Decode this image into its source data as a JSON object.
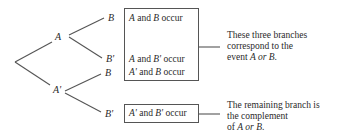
{
  "nodes": {
    "a": "A",
    "a_prime": "A'",
    "b_upper": "B",
    "b_prime_upper": "B'",
    "b_lower": "B",
    "b_prime_lower": "B'"
  },
  "outcomes": [
    {
      "first": "A",
      "mid": " and ",
      "second": "B",
      "tail": " occur"
    },
    {
      "first": "A",
      "mid": " and ",
      "second": "B'",
      "tail": " occur"
    },
    {
      "first": "A'",
      "mid": " and ",
      "second": "B",
      "tail": " occur"
    },
    {
      "first": "A'",
      "mid": " and ",
      "second": "B'",
      "tail": " occur"
    }
  ],
  "annotations": {
    "union": {
      "line1": "These three branches",
      "line2": "correspond to the",
      "line3_pre": "event ",
      "line3_em": "A or B",
      "line3_post": "."
    },
    "complement": {
      "line1": "The remaining branch is",
      "line2": "the complement",
      "line3_pre": "of ",
      "line3_em": "A or B",
      "line3_post": "."
    }
  }
}
